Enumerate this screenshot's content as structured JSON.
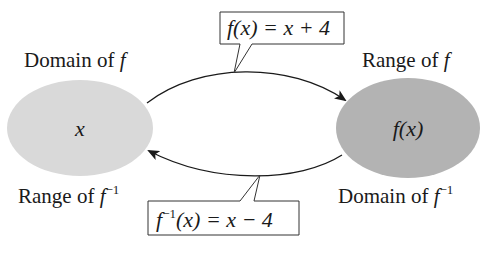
{
  "diagram": {
    "type": "function-inverse-mapping",
    "left_set": {
      "top_label_prefix": "Domain of ",
      "top_label_fn": "f",
      "bottom_label_prefix": "Range of ",
      "bottom_label_fn": "f",
      "bottom_label_sup": "−1",
      "element": "x",
      "fill": "#d9d9d9"
    },
    "right_set": {
      "top_label_prefix": "Range of ",
      "top_label_fn": "f",
      "bottom_label_prefix": "Domain of ",
      "bottom_label_fn": "f",
      "bottom_label_sup": "−1",
      "element": "f(x)",
      "fill": "#b3b3b3"
    },
    "top_callout": {
      "lhs": "f(x)",
      "rest": " = x + 4"
    },
    "bottom_callout": {
      "fn": "f",
      "sup": "−1",
      "rest": "(x) = x − 4"
    },
    "arrows": [
      {
        "from": "left_set",
        "to": "right_set",
        "label_ref": "top_callout"
      },
      {
        "from": "right_set",
        "to": "left_set",
        "label_ref": "bottom_callout"
      }
    ]
  }
}
